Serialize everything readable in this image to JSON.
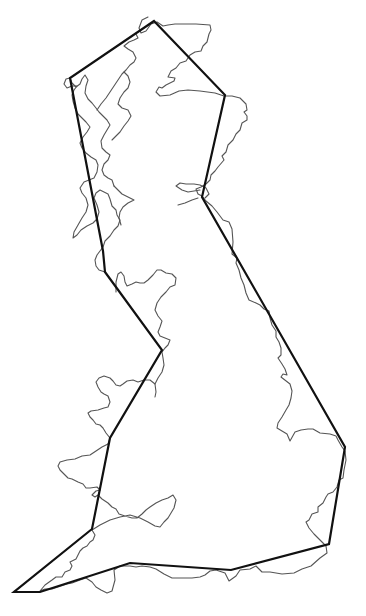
{
  "map": {
    "subject": "Great Britain coastline with simplified outline polygon",
    "colors": {
      "background": "#ffffff",
      "coastline": "#555555",
      "polygon": "#111111"
    },
    "polygon_vertices": [
      [
        154,
        21
      ],
      [
        225,
        95
      ],
      [
        202,
        197
      ],
      [
        345,
        447
      ],
      [
        329,
        544
      ],
      [
        231,
        570
      ],
      [
        130,
        563
      ],
      [
        40,
        592
      ],
      [
        14,
        592
      ],
      [
        92,
        529
      ],
      [
        110,
        438
      ],
      [
        162,
        350
      ],
      [
        105,
        272
      ],
      [
        103,
        251
      ],
      [
        70,
        78
      ]
    ],
    "coastline_paths": [
      "M148,17 L142,20 L139,28 L141,33 L146,31 L151,24 L157,22 L163,26 L168,25 L175,24 L186,24 L196,24 L210,25 L211,30 L209,34 L207,42 L203,46 L201,51 L195,52 L190,55 L186,61 L180,63 L176,68 L171,71 L168,77 L175,78 L174,81 L166,85 L162,88 L159,87 L156,92 L160,96 L170,95 L179,91 L188,90 L200,91 L215,93 L224,96 L232,96 L240,98 L246,104 L247,110 L244,112 L247,116 L247,120 L242,123 L240,130 L236,134 L233,140 L228,145 L226,152 L222,156 L224,160 L218,167 L215,171 L211,175 L210,180 L206,184 L201,187 L196,189 L198,194 L202,196 L206,201 L212,206 L217,212 L220,216 L223,220 L229,222 L232,229 L233,242 L232,254 L237,258 L236,263 L239,270 L241,278 L244,285 L246,293 L249,300 L256,303 L260,305 L264,309 L269,311 L270,318 L272,325 L276,331 L276,337 L279,342 L281,348 L281,355 L278,358 L282,364 L285,369 L287,375 L283,374 L281,377 L290,384 L292,391 L291,398 L289,405 L286,410 L282,417 L278,423 L277,428 L282,431 L287,434 L290,441 L295,432 L301,430 L308,429 L313,429 L320,433 L330,434 L336,436 L338,440 L342,447 L345,451 L346,460 L344,470 L343,478 L339,480 L337,487 L333,492 L328,494 L326,497 L323,503 L318,507 L318,512 L312,514 L309,520 L306,522 L309,528 L314,534 L318,538 L322,542 L326,546 L327,553 L320,558 L311,566 L302,569 L294,573 L282,574 L270,572 L262,572 L256,566 L250,569 L240,570 L236,576 L229,581 L225,573 L216,570 L210,571 L205,575 L200,577 L192,578 L183,578 L172,578 L164,574 L156,569 L150,567 L142,566 L136,567 L130,566 L120,566 L114,570 L115,580 L112,591 L107,593 L101,590 L96,587 L92,582 L86,578 L80,580 L72,583 L67,584 L58,587 L52,589 L45,589 L40,591 L45,585 L52,580 L56,577 L62,577 L65,572 L70,570 L72,566 L70,562 L76,559 L80,551 L83,548 L87,546 L90,542 L93,540 L95,535 L92,530",
      "M92,530 L100,525 L110,520 L120,517 L130,515 L140,518 L148,522 L155,526 L160,527 L164,522 L168,518 L171,513 L174,508 L176,500 L173,495 L168,498 L162,500 L156,503 L150,507 L146,510 L142,514 L137,518 L132,518 L125,516 L119,514 L116,509 L112,507 L108,503 L102,499 L98,495 L95,497 L92,495 L96,491 L100,490",
      "M100,490 L97,487 L90,488 L86,488 L83,484 L78,482 L72,479 L68,478 L64,474 L60,470 L58,466 L60,462 L67,460 L75,459 L82,456 L90,455 L96,451 L102,447 L108,444",
      "M108,444 L110,438 L106,433 L103,428 L100,425 L96,424 L93,420 L90,417 L88,413 L91,411 L98,410 L104,408 L108,407 L110,402 L108,396 L104,394 L101,392 L98,387 L96,382 L99,378 L104,376 L110,378 L113,381 L116,385 L120,386 L123,384 L127,381 L133,380 L138,382 L144,380 L150,380 L155,384 L156,392 L155,397",
      "M155,384 L158,378 L162,372 L164,365 L163,358 L162,352 L165,348 L168,345 L170,340 L165,338 L160,336 L158,332 L160,327 L162,321 L158,316 L155,310 L157,303 L161,297 L166,292 L170,287 L175,285 L176,278 L172,274 L166,273 L161,270 L157,270 L153,275 L148,280 L144,283 L140,283 L136,282 L132,284 L127,286 L125,282 L124,276 L121,272 L118,274 L116,282 L116,292",
      "M105,272 L99,270 L96,266 L95,260 L97,255 L100,251 L103,247 L105,241 L110,236 L114,230 L118,226 L120,220 L117,215 L116,210 L112,206 L110,199 L108,194 L104,192 L100,190 L96,193 L94,198 L97,205 L99,212 L97,219 L93,223 L87,226 L81,230 L77,235 L73,238 L74,232 L78,225 L82,218 L86,212 L88,205 L86,198 L82,193 L80,188 L84,182 L89,180 L94,178 L97,172 L98,165 L96,160 L91,157 L86,153 L82,148 L80,143 L83,137 L87,132 L90,127 L86,122 L82,118 L78,114 L75,108 L73,101 L72,95 L74,90 L77,86 L72,86 L67,88 L64,84 L66,79 L70,78",
      "M70,78 L72,83 L76,87 L80,84 L82,79 L85,75 L88,80 L86,86 L85,93 L88,99 L92,103 L96,108 L99,112 L103,116 L107,120 L110,125 L107,130 L104,135 L101,141 L102,148 L106,152 L110,155 L108,160 L104,164 L102,170 L104,175 L108,178 L112,180 L114,186",
      "M114,186 L118,190 L122,194 L126,196 L130,198 L134,200 L128,203 L123,207 L120,212 L119,218 L121,225",
      "M97,110 L101,104 L106,98 L110,92 L114,86 L118,80 L122,74 L126,70 L130,65 L134,62 L136,58 L133,52 L128,49 L124,46 L129,42 L134,40 L138,38 L136,34",
      "M112,140 L116,136 L120,132 L124,126 L128,121 L131,116 L128,110 L122,108 L118,104 L120,98 L124,92 L128,88 L130,82 L128,76 L124,72",
      "M205,198 L209,194 L206,188 L200,185 L194,184 L186,184 L180,183 L176,186 L182,190 L188,192 L194,191 L200,190",
      "M178,205 L185,203 L192,200 L198,198"
    ]
  }
}
